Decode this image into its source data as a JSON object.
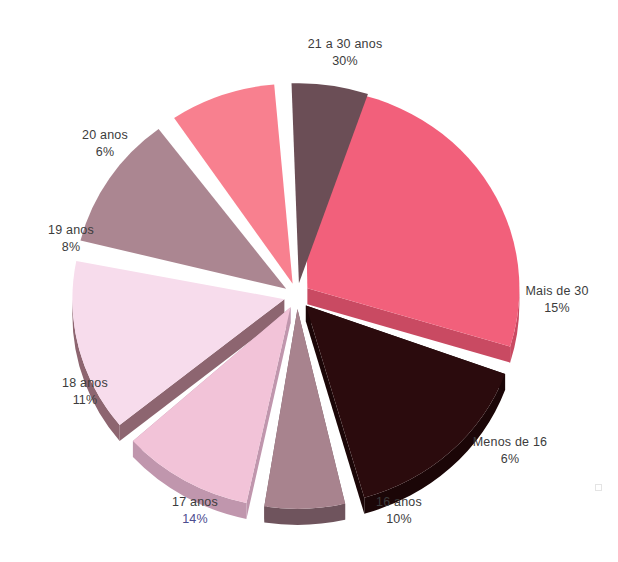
{
  "chart_data": {
    "type": "pie",
    "title": "",
    "subtitle": "",
    "xlabel": "",
    "ylabel": "",
    "legend_position": "none",
    "grid": false,
    "style": "3d-exploded",
    "units": "percent",
    "total": 100,
    "categories": [
      "21 a 30 anos",
      "Mais de 30",
      "Menos de 16",
      "16 anos",
      "17 anos",
      "18 anos",
      "19 anos",
      "20 anos"
    ],
    "values": [
      30,
      15,
      6,
      10,
      14,
      11,
      8,
      6
    ],
    "labels": [
      "30%",
      "15%",
      "6%",
      "10%",
      "14%",
      "11%",
      "8%",
      "6%"
    ],
    "colors": [
      "#f2607b",
      "#2b0b0d",
      "#a8838e",
      "#f2c3d8",
      "#f7dcec",
      "#ab8691",
      "#f8808f",
      "#6b4e56"
    ],
    "slices": [
      {
        "name": "21 a 30 anos",
        "value": 30,
        "label": "30%",
        "color": "#f2607b",
        "side_color": "#c94a62",
        "start_angle": -91,
        "end_angle": 17,
        "exploded": true
      },
      {
        "name": "Mais de 30",
        "value": 15,
        "label": "15%",
        "color": "#2b0b0d",
        "side_color": "#1b0607",
        "start_angle": 20,
        "end_angle": 74,
        "exploded": true
      },
      {
        "name": "Menos de 16",
        "value": 6,
        "label": "6%",
        "color": "#a8838e",
        "side_color": "#6f545d",
        "start_angle": 77,
        "end_angle": 99,
        "exploded": true
      },
      {
        "name": "16 anos",
        "value": 10,
        "label": "10%",
        "color": "#f2c3d8",
        "side_color": "#c096ad",
        "start_angle": 102,
        "end_angle": 138,
        "exploded": true
      },
      {
        "name": "17 anos",
        "value": 14,
        "label": "14%",
        "color": "#f7dcec",
        "side_color": "#8d6570",
        "start_angle": 141,
        "end_angle": 191,
        "exploded": true
      },
      {
        "name": "18 anos",
        "value": 11,
        "label": "11%",
        "color": "#ab8691",
        "side_color": "#7d5c66",
        "start_angle": 194,
        "end_angle": 233,
        "exploded": true
      },
      {
        "name": "19 anos",
        "value": 8,
        "label": "8%",
        "color": "#f8808f",
        "side_color": "#c45c6c",
        "start_angle": 236,
        "end_angle": 265,
        "exploded": true
      },
      {
        "name": "20 anos",
        "value": 6,
        "label": "6%",
        "color": "#6b4e56",
        "side_color": "#4a343a",
        "start_angle": 268,
        "end_angle": 289,
        "exploded": true
      }
    ]
  },
  "labels": {
    "s0": {
      "name": "21 a 30 anos",
      "pct": "30%"
    },
    "s1": {
      "name": "Mais de 30",
      "pct": "15%"
    },
    "s2": {
      "name": "Menos de 16",
      "pct": "6%"
    },
    "s3": {
      "name": "16 anos",
      "pct": "10%"
    },
    "s4": {
      "name": "17 anos",
      "pct": "14%"
    },
    "s5": {
      "name": "18 anos",
      "pct": "11%"
    },
    "s6": {
      "name": "19 anos",
      "pct": "8%"
    },
    "s7": {
      "name": "20 anos",
      "pct": "6%"
    }
  },
  "colors": {
    "background": "#ffffff",
    "label_text": "#3c3c3c",
    "label_pct_accent": "#4c4c8f"
  }
}
